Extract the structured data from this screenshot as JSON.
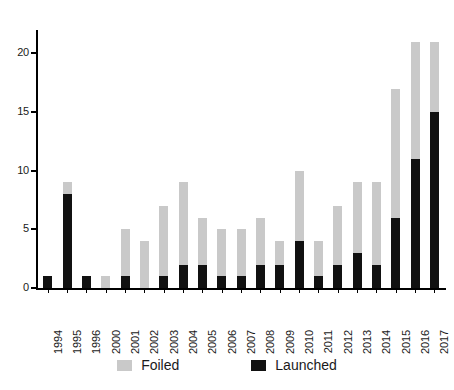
{
  "chart_data": {
    "type": "bar",
    "subtype": "stacked-vertical-bar",
    "title": "",
    "subtitle": "",
    "xlabel": "",
    "ylabel": "",
    "ylim": [
      0,
      22
    ],
    "y_ticks": [
      0,
      5,
      10,
      15,
      20
    ],
    "y_tick_labels": [
      "0",
      "5",
      "10",
      "15",
      "20"
    ],
    "grid": false,
    "legend_position": "bottom",
    "categories": [
      "1994",
      "1995",
      "1996",
      "2000",
      "2001",
      "2002",
      "2003",
      "2004",
      "2005",
      "2006",
      "2007",
      "2008",
      "2009",
      "2010",
      "2011",
      "2012",
      "2013",
      "2014",
      "2015",
      "2016",
      "2017"
    ],
    "series": [
      {
        "name": "Launched",
        "color": "#111111",
        "values": [
          1,
          8,
          1,
          0,
          1,
          0,
          1,
          2,
          2,
          1,
          1,
          2,
          2,
          4,
          1,
          2,
          3,
          2,
          6,
          11,
          15
        ]
      },
      {
        "name": "Foiled",
        "color": "#c9c9c9",
        "values": [
          0,
          1,
          0,
          1,
          4,
          4,
          6,
          7,
          4,
          4,
          4,
          4,
          2,
          6,
          3,
          5,
          6,
          7,
          11,
          10,
          6
        ]
      }
    ],
    "totals": [
      1,
      9,
      1,
      1,
      5,
      4,
      7,
      9,
      6,
      5,
      5,
      6,
      4,
      10,
      4,
      7,
      9,
      9,
      17,
      21,
      21
    ],
    "annotations": []
  },
  "legend": {
    "items": [
      {
        "label": "Foiled",
        "color": "#c9c9c9",
        "swatch": "foiled"
      },
      {
        "label": "Launched",
        "color": "#111111",
        "swatch": "launched"
      }
    ]
  },
  "colors": {
    "foiled": "#c9c9c9",
    "launched": "#111111",
    "axis": "#000000",
    "text": "#1a1a1a",
    "background": "#ffffff"
  }
}
